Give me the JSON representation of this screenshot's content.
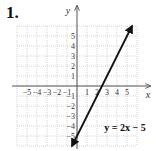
{
  "problem_number": "1.",
  "chart_data": {
    "type": "line",
    "title": "",
    "xlabel": "x",
    "ylabel": "y",
    "xlim": [
      -6,
      6
    ],
    "ylim": [
      -6,
      6
    ],
    "grid": true,
    "x_ticks": [
      "-5",
      "-4",
      "-3",
      "-2",
      "-1",
      "1",
      "2",
      "3",
      "4",
      "5"
    ],
    "y_ticks": [
      "5",
      "4",
      "3",
      "2",
      "1",
      "-1",
      "-2",
      "-3",
      "-4",
      "-5"
    ],
    "series": [
      {
        "name": "y = 2x − 5",
        "equation": "y = 2x − 5",
        "slope": 2,
        "intercept": -5,
        "x": [
          -0.5,
          0,
          2.5,
          5.5
        ],
        "y": [
          -6,
          -5,
          0,
          6
        ],
        "arrows": "both"
      }
    ],
    "annotations": [
      {
        "text": "y = 2x − 5",
        "x": 4.8,
        "y": -4.5
      }
    ],
    "colors": {
      "line": "#111111",
      "axis": "#555555",
      "grid": "#bbbbbb"
    }
  }
}
